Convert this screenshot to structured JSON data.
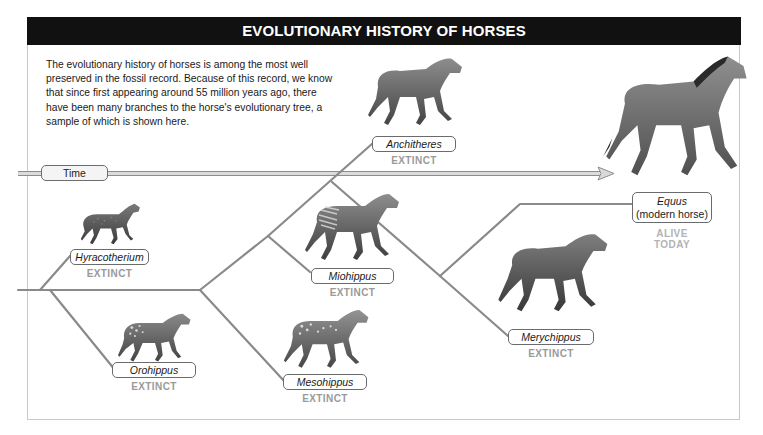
{
  "header": {
    "title": "EVOLUTIONARY HISTORY OF HORSES"
  },
  "intro": {
    "text": "The evolutionary history of horses is among the most well preserved in the fossil record. Because of this record, we know that since first appearing around 55 million years ago, there have been many branches to the horse's evolutionary tree, a sample of which is shown here."
  },
  "timeline": {
    "label": "Time",
    "icon": "arrow-right-icon"
  },
  "colors": {
    "header_bg": "#111111",
    "branch_line": "#8a8a8a",
    "status_extinct": "#9a9a9a",
    "status_alive": "#b3b3b3"
  },
  "species": [
    {
      "name": "Hyracotherium",
      "status": "EXTINCT",
      "coat": "speckled"
    },
    {
      "name": "Orohippus",
      "status": "EXTINCT",
      "coat": "spotted"
    },
    {
      "name": "Mesohippus",
      "status": "EXTINCT",
      "coat": "spotted"
    },
    {
      "name": "Miohippus",
      "status": "EXTINCT",
      "coat": "striped"
    },
    {
      "name": "Anchitheres",
      "status": "EXTINCT",
      "coat": "plain"
    },
    {
      "name": "Merychippus",
      "status": "EXTINCT",
      "coat": "plain"
    },
    {
      "name": "Equus",
      "subtitle": "(modern horse)",
      "status_line1": "ALIVE",
      "status_line2": "TODAY",
      "coat": "plain-dark-mane"
    }
  ]
}
